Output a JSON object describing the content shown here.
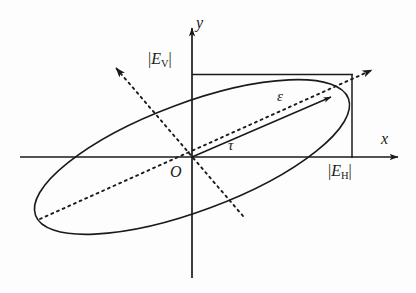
{
  "figure": {
    "kind": "polarization-ellipse-diagram",
    "background_color": "#fdfdfd",
    "ink_color": "#1a1a1a",
    "axes": {
      "x_label": "x",
      "y_label": "y",
      "origin_label": "O",
      "x_axis": {
        "x1": 20,
        "y1": 157,
        "x2": 404,
        "y2": 157,
        "arrow": "right"
      },
      "y_axis": {
        "x1": 192,
        "y1": 278,
        "x2": 192,
        "y2": 22,
        "arrow": "up"
      }
    },
    "labels": {
      "vertical_amplitude": {
        "open_bar": "|",
        "symbol": "E",
        "subscript": "V",
        "close_bar": "|"
      },
      "horizontal_amplitude": {
        "open_bar": "|",
        "symbol": "E",
        "subscript": "H",
        "close_bar": "|"
      },
      "ellipticity_angle": "ε",
      "orientation_angle": "τ"
    },
    "ellipse": {
      "center_x": 192,
      "center_y": 157,
      "semi_major": 167,
      "semi_minor": 54,
      "rotation_deg": -20.5,
      "stroke_width": 1.5
    },
    "bounding_box": {
      "note": "solid rectangle marking |E_V| height and |E_H| width",
      "left": 192,
      "top": 74,
      "right": 352,
      "bottom": 157
    },
    "major_axis_dashed": {
      "from": {
        "x": 40,
        "y": 219
      },
      "to": {
        "x": 378,
        "y": 68
      },
      "arrow": "upper-right",
      "dash": "2,4"
    },
    "minor_axis_dashed": {
      "from": {
        "x": 243,
        "y": 216
      },
      "to": {
        "x": 112,
        "y": 64
      },
      "arrow": "upper-left",
      "dash": "2,4"
    },
    "semi_major_solid_ray": {
      "from": {
        "x": 192,
        "y": 157
      },
      "to": {
        "x": 336,
        "y": 95
      },
      "arrow": "tip"
    }
  }
}
